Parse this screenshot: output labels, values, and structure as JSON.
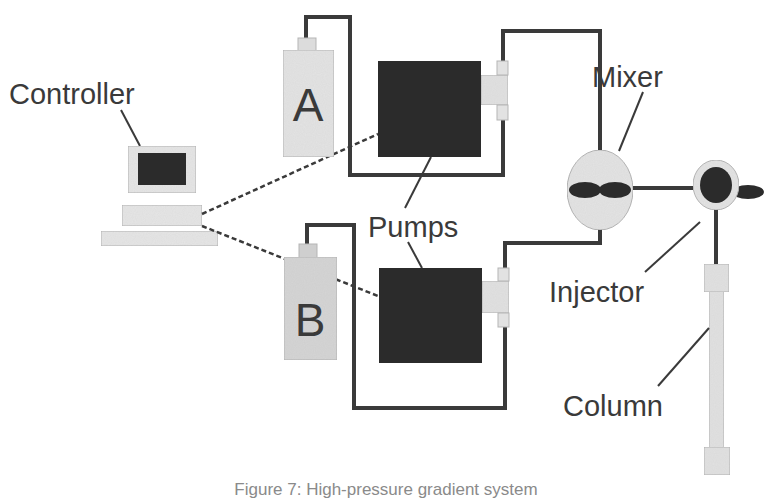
{
  "diagram": {
    "colors": {
      "line": "#3a3a3a",
      "dark_fill": "#2b2b2b",
      "light_fill": "#e2e2e2",
      "stroke_light": "#b5b5b5",
      "text": "#3a3a3a",
      "background": "#ffffff"
    },
    "labels": {
      "controller": "Controller",
      "bottle_a": "A",
      "bottle_b": "B",
      "pumps": "Pumps",
      "mixer": "Mixer",
      "injector": "Injector",
      "column": "Column"
    },
    "components": [
      {
        "id": "controller",
        "label": "Controller",
        "type": "computer"
      },
      {
        "id": "solvent-a",
        "label": "A",
        "type": "reservoir"
      },
      {
        "id": "solvent-b",
        "label": "B",
        "type": "reservoir"
      },
      {
        "id": "pump-a",
        "label": "Pumps",
        "type": "pump"
      },
      {
        "id": "pump-b",
        "label": "Pumps",
        "type": "pump"
      },
      {
        "id": "mixer",
        "label": "Mixer",
        "type": "mixer"
      },
      {
        "id": "injector",
        "label": "Injector",
        "type": "injector"
      },
      {
        "id": "column",
        "label": "Column",
        "type": "column"
      }
    ],
    "connections": [
      {
        "from": "controller",
        "to": "pump-a",
        "style": "dashed"
      },
      {
        "from": "controller",
        "to": "pump-b",
        "style": "dashed"
      },
      {
        "from": "solvent-a",
        "to": "pump-a",
        "style": "solid"
      },
      {
        "from": "solvent-b",
        "to": "pump-b",
        "style": "solid"
      },
      {
        "from": "pump-a",
        "to": "mixer",
        "style": "solid"
      },
      {
        "from": "pump-b",
        "to": "mixer",
        "style": "solid"
      },
      {
        "from": "mixer",
        "to": "injector",
        "style": "solid"
      },
      {
        "from": "injector",
        "to": "column",
        "style": "solid"
      }
    ],
    "caption": "Figure 7: High-pressure gradient system"
  }
}
